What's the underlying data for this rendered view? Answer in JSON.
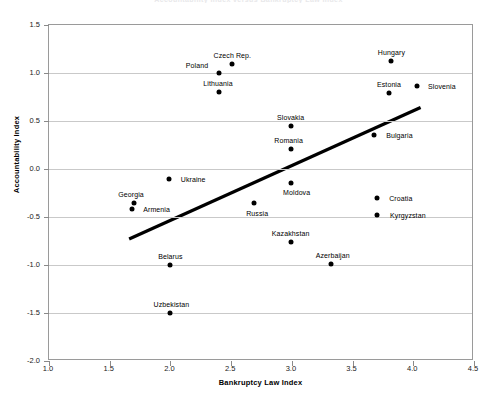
{
  "chart_data": {
    "type": "scatter",
    "title": "Accountability Index versus Bankruptcy Law Index",
    "xlabel": "Bankruptcy Law Index",
    "ylabel": "Accountability Index",
    "xlim": [
      1.0,
      4.5
    ],
    "ylim": [
      -2.0,
      1.5
    ],
    "xticks": [
      "1.0",
      "1.5",
      "2.0",
      "2.5",
      "3.0",
      "3.5",
      "4.0",
      "4.5"
    ],
    "xtick_values": [
      1.0,
      1.5,
      2.0,
      2.5,
      3.0,
      3.5,
      4.0,
      4.5
    ],
    "yticks": [
      "1.5",
      "1.0",
      "0.5",
      "0.0",
      "-0.5",
      "-1.0",
      "-1.5",
      "-2.0"
    ],
    "ytick_values": [
      1.5,
      1.0,
      0.5,
      0.0,
      -0.5,
      -1.0,
      -1.5,
      -2.0
    ],
    "grid": true,
    "legend": "none",
    "points": [
      {
        "label": "Czech Rep.",
        "x": 2.51,
        "y": 1.09,
        "label_dx": 0,
        "label_dy": -9
      },
      {
        "label": "Hungary",
        "x": 3.82,
        "y": 1.12,
        "label_dx": 0,
        "label_dy": -9
      },
      {
        "label": "Poland",
        "x": 2.4,
        "y": 1.0,
        "label_dx": -22,
        "label_dy": -8
      },
      {
        "label": "Lithuania",
        "x": 2.4,
        "y": 0.8,
        "label_dx": -1,
        "label_dy": -9
      },
      {
        "label": "Estonia",
        "x": 3.8,
        "y": 0.79,
        "label_dx": 0,
        "label_dy": -9
      },
      {
        "label": "Slovenia",
        "x": 4.03,
        "y": 0.86,
        "label_dx": 25,
        "label_dy": 0
      },
      {
        "label": "Slovakia",
        "x": 2.99,
        "y": 0.45,
        "label_dx": 0,
        "label_dy": -9
      },
      {
        "label": "Bulgaria",
        "x": 3.68,
        "y": 0.35,
        "label_dx": 25,
        "label_dy": 0
      },
      {
        "label": "Romania",
        "x": 2.99,
        "y": 0.21,
        "label_dx": -2,
        "label_dy": -9
      },
      {
        "label": "Ukraine",
        "x": 1.99,
        "y": -0.1,
        "label_dx": 24,
        "label_dy": 0
      },
      {
        "label": "Moldova",
        "x": 2.99,
        "y": -0.15,
        "label_dx": 6,
        "label_dy": 9
      },
      {
        "label": "Georgia",
        "x": 1.7,
        "y": -0.35,
        "label_dx": -3,
        "label_dy": -9
      },
      {
        "label": "Armenia",
        "x": 1.68,
        "y": -0.42,
        "label_dx": 25,
        "label_dy": 0
      },
      {
        "label": "Russia",
        "x": 2.69,
        "y": -0.35,
        "label_dx": 3,
        "label_dy": 10
      },
      {
        "label": "Croatia",
        "x": 3.7,
        "y": -0.3,
        "label_dx": 24,
        "label_dy": 0
      },
      {
        "label": "Kyrgyzstan",
        "x": 3.7,
        "y": -0.48,
        "label_dx": 31,
        "label_dy": 0
      },
      {
        "label": "Kazakhstan",
        "x": 2.99,
        "y": -0.76,
        "label_dx": 0,
        "label_dy": -9
      },
      {
        "label": "Belarus",
        "x": 2.0,
        "y": -1.0,
        "label_dx": 0,
        "label_dy": -9
      },
      {
        "label": "Azerbaijan",
        "x": 3.32,
        "y": -0.99,
        "label_dx": 2,
        "label_dy": -9
      },
      {
        "label": "Uzbekistan",
        "x": 2.0,
        "y": -1.5,
        "label_dx": 1,
        "label_dy": -9
      }
    ],
    "trendline": {
      "x0": 1.66,
      "y0": -0.73,
      "x1": 4.06,
      "y1": 0.64,
      "width": 3.2,
      "color": "#000000"
    }
  }
}
